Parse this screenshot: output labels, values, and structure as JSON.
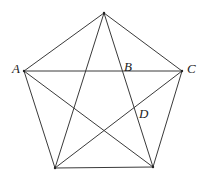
{
  "diagram": {
    "type": "pentagon-with-diagonals",
    "line_color": "#3a3a3a",
    "vertices": [
      {
        "id": "top",
        "x": 104,
        "y": 13,
        "label": ""
      },
      {
        "id": "A",
        "x": 24,
        "y": 71,
        "label": "A"
      },
      {
        "id": "C",
        "x": 182,
        "y": 71,
        "label": "C"
      },
      {
        "id": "bottom_left",
        "x": 55,
        "y": 168,
        "label": ""
      },
      {
        "id": "bottom_right",
        "x": 153,
        "y": 167,
        "label": ""
      }
    ],
    "labels": {
      "A": {
        "text": "A",
        "x": 12,
        "y": 73
      },
      "B": {
        "text": "B",
        "x": 124,
        "y": 71
      },
      "C": {
        "text": "C",
        "x": 187,
        "y": 73
      },
      "D": {
        "text": "D",
        "x": 139,
        "y": 118
      }
    }
  }
}
